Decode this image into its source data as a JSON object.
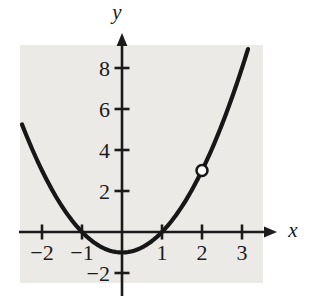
{
  "chart_data": {
    "type": "line",
    "title": "",
    "xlabel": "x",
    "ylabel": "y",
    "series": [
      {
        "name": "y = x^2 - 1",
        "equation": "x^2 - 1",
        "coefficients": {
          "a": 1,
          "b": 0,
          "c": -1
        },
        "x_start": -2.5,
        "x_end": 3.15,
        "sample_points": [
          {
            "x": -2,
            "y": 3
          },
          {
            "x": -1,
            "y": 0
          },
          {
            "x": 0,
            "y": -1
          },
          {
            "x": 1,
            "y": 0
          },
          {
            "x": 2,
            "y": 3
          },
          {
            "x": 3,
            "y": 8
          }
        ]
      }
    ],
    "hole_point": {
      "x": 2,
      "y": 3
    },
    "x_ticks": [
      -2,
      -1,
      1,
      2,
      3
    ],
    "y_ticks": [
      -2,
      2,
      4,
      6,
      8
    ],
    "xlim": [
      -2.65,
      3.9
    ],
    "ylim": [
      -3.2,
      9.7
    ],
    "grid": false,
    "legend": "none",
    "colors": {
      "curve": "#171717",
      "axis": "#1b1b1b",
      "label": "#1b1b1b",
      "plot_background": "#ebeae6",
      "page_background": "#ffffff",
      "hole_fill": "#ffffff"
    }
  }
}
